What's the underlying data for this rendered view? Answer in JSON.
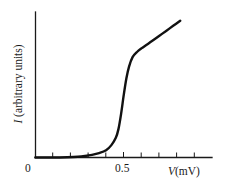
{
  "chart_data": {
    "type": "line",
    "title": "",
    "subtitle": "",
    "xlabel_symbol": "V",
    "xlabel_units": "(mV)",
    "xlabel": "V (mV)",
    "ylabel_symbol": "I",
    "ylabel_units": "(arbitrary units)",
    "ylabel": "I (arbitrary units)",
    "xlim": [
      0,
      1.0
    ],
    "ylim": [
      0,
      1.0
    ],
    "grid": false,
    "legend": "none",
    "x_tick_labels": [
      "0",
      "0.5"
    ],
    "x_tick_label_values": [
      0,
      0.5
    ],
    "x_minor_tick_values": [
      0.1,
      0.2,
      0.3,
      0.4,
      0.6,
      0.7,
      0.8,
      0.9
    ],
    "y_tick_labels": [],
    "curve_color": "#111111",
    "axis_color": "#1a1a1a",
    "background_color": "#ffffff",
    "series": [
      {
        "name": "I-V characteristic",
        "x": [
          0.0,
          0.1,
          0.18,
          0.24,
          0.28,
          0.32,
          0.36,
          0.4,
          0.43,
          0.455,
          0.47,
          0.485,
          0.5,
          0.515,
          0.53,
          0.55,
          0.575,
          0.6,
          0.63,
          0.66,
          0.7,
          0.74,
          0.78,
          0.82
        ],
        "y": [
          0.0,
          0.0,
          0.002,
          0.005,
          0.01,
          0.018,
          0.03,
          0.05,
          0.085,
          0.135,
          0.195,
          0.3,
          0.43,
          0.545,
          0.625,
          0.69,
          0.725,
          0.75,
          0.775,
          0.8,
          0.835,
          0.87,
          0.905,
          0.94
        ]
      }
    ]
  },
  "axes": {
    "x_label_zero": "0",
    "x_label_half": "0.5"
  }
}
